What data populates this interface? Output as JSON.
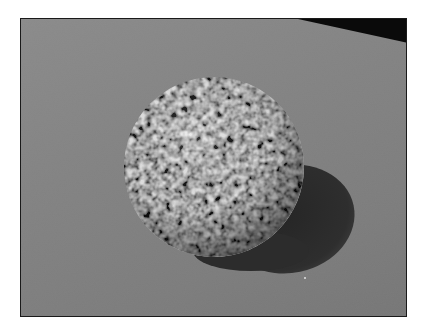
{
  "image": {
    "description": "Rendered grayscale 3D scene: textured mottled sphere resting on a flat gray plane, casting a dark shadow to the lower right",
    "frame": {
      "x": 20,
      "y": 18,
      "width": 387,
      "height": 299,
      "border_color": "#1a1a1a"
    },
    "page_background": "#ffffff",
    "plane": {
      "color_light": "#8a8a8a",
      "color_dark": "#767676"
    },
    "background_wedge": {
      "color": "#0a0a0a",
      "points": "277,0 387,0 387,24"
    },
    "sphere": {
      "cx": 193,
      "cy": 148,
      "r": 90,
      "base_color": "#6e6e6e",
      "highlight_color": "#bdbdbd",
      "shadow_color": "#2e2e2e"
    },
    "cast_shadow": {
      "cx": 268,
      "cy": 198,
      "rx": 66,
      "ry": 55,
      "color": "#2c2c2c"
    },
    "speck": {
      "x": 283,
      "y": 258,
      "color": "#c8c8c8"
    }
  }
}
